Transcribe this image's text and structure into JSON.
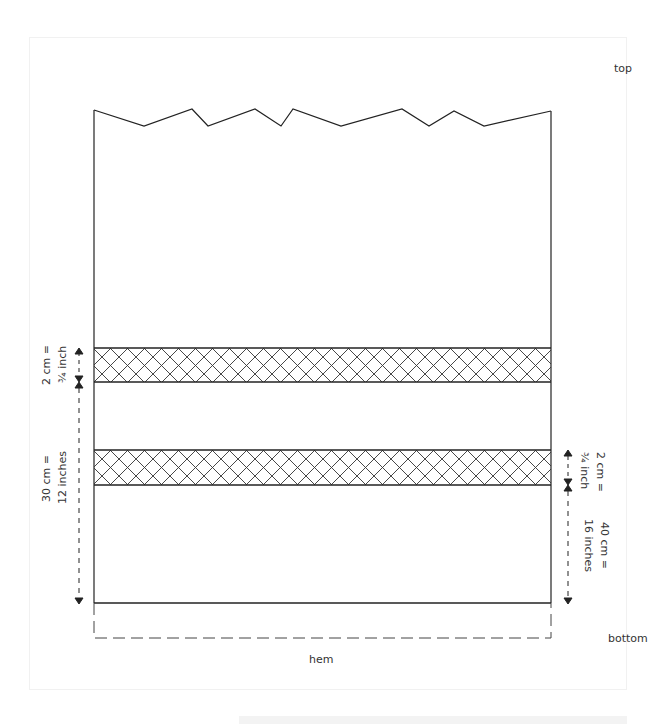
{
  "diagram": {
    "labels": {
      "top": "top",
      "bottom": "bottom",
      "hem": "hem"
    },
    "left_measurements": {
      "band_height": {
        "line1": "2 cm =",
        "line2": "¾ inch"
      },
      "gap_to_hem": {
        "line1": "30 cm =",
        "line2": "12 inches"
      }
    },
    "right_measurements": {
      "band_height": {
        "line1": "2 cm =",
        "line2": "¾ inch"
      },
      "gap_to_hem": {
        "line1": "40 cm =",
        "line2": "16 inches"
      }
    },
    "colors": {
      "line": "#222222",
      "text": "#333333"
    }
  }
}
